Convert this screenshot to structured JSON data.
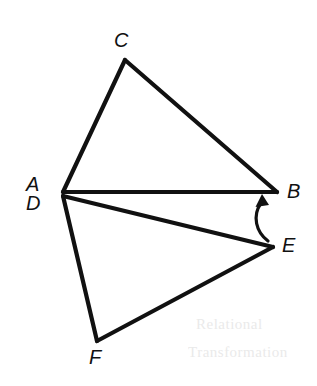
{
  "figure": {
    "canvas": {
      "width": 317,
      "height": 386,
      "background": "#ffffff"
    },
    "stroke_color": "#111111",
    "label_color": "#111111",
    "points": {
      "A": {
        "x": 63,
        "y": 192,
        "label": "A",
        "label_x": 26,
        "label_y": 174
      },
      "B": {
        "x": 277,
        "y": 192,
        "label": "B",
        "label_x": 287,
        "label_y": 181
      },
      "C": {
        "x": 125,
        "y": 60,
        "label": "C",
        "label_x": 114,
        "label_y": 30
      },
      "D": {
        "x": 63,
        "y": 196,
        "label": "D",
        "label_x": 26,
        "label_y": 193
      },
      "E": {
        "x": 273,
        "y": 247,
        "label": "E",
        "label_x": 282,
        "label_y": 235
      },
      "F": {
        "x": 97,
        "y": 341,
        "label": "F",
        "label_x": 89,
        "label_y": 347
      }
    },
    "segments": [
      {
        "name": "segment-AC",
        "from": "A",
        "to": "C"
      },
      {
        "name": "segment-CB",
        "from": "C",
        "to": "B"
      },
      {
        "name": "segment-AB",
        "from": "A",
        "to": "B"
      },
      {
        "name": "segment-DE",
        "from": "D",
        "to": "E"
      },
      {
        "name": "segment-EF",
        "from": "E",
        "to": "F"
      },
      {
        "name": "segment-FD",
        "from": "F",
        "to": "D"
      }
    ],
    "arrow": {
      "name": "rotation-arrow",
      "description": "curved arrow from E sweeping counterclockwise up to B",
      "path": "M 268 241 C 256 232, 252 216, 261 203",
      "head": "262,194 256.5,206 268,205.5"
    },
    "ghost_marks": [
      {
        "text": "Relational",
        "x": 196,
        "y": 316
      },
      {
        "text": "Transformation",
        "x": 188,
        "y": 344
      }
    ]
  }
}
